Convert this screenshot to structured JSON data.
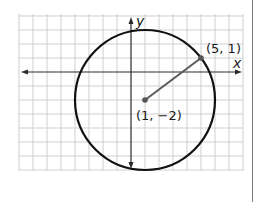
{
  "diagram": {
    "type": "coordinate-plane-circle",
    "axes": {
      "x_label": "x",
      "y_label": "y"
    },
    "center": {
      "label": "(1, −2)",
      "x": 1,
      "y": -2
    },
    "point_on_circle": {
      "label": "(5, 1)",
      "x": 5,
      "y": 1
    },
    "radius": 5,
    "grid": {
      "x_min": -8,
      "x_max": 8,
      "y_min": -7,
      "y_max": 4,
      "step": 1
    },
    "colors": {
      "grid": "#cfcfcf",
      "axis": "#2a2a2a",
      "circle": "#111111",
      "radius_segment": "#5a5a5a",
      "point": "#555555",
      "right_rule": "#7a7a7a"
    }
  }
}
